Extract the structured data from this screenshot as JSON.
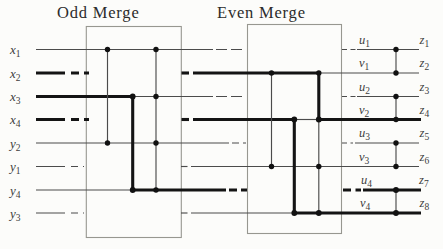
{
  "figure": {
    "titles": {
      "odd_merge": "Odd Merge",
      "even_merge": "Even Merge"
    },
    "inputs": [
      {
        "base": "x",
        "sub": "1"
      },
      {
        "base": "x",
        "sub": "2"
      },
      {
        "base": "x",
        "sub": "3"
      },
      {
        "base": "x",
        "sub": "4"
      },
      {
        "base": "y",
        "sub": "2"
      },
      {
        "base": "y",
        "sub": "1"
      },
      {
        "base": "y",
        "sub": "4"
      },
      {
        "base": "y",
        "sub": "3"
      }
    ],
    "intermediate": [
      {
        "base": "u",
        "sub": "1"
      },
      {
        "base": "v",
        "sub": "1"
      },
      {
        "base": "u",
        "sub": "2"
      },
      {
        "base": "v",
        "sub": "2"
      },
      {
        "base": "u",
        "sub": "3"
      },
      {
        "base": "v",
        "sub": "3"
      },
      {
        "base": "u",
        "sub": "4"
      },
      {
        "base": "v",
        "sub": "4"
      }
    ],
    "outputs": [
      {
        "base": "z",
        "sub": "1"
      },
      {
        "base": "z",
        "sub": "2"
      },
      {
        "base": "z",
        "sub": "3"
      },
      {
        "base": "z",
        "sub": "4"
      },
      {
        "base": "z",
        "sub": "5"
      },
      {
        "base": "z",
        "sub": "6"
      },
      {
        "base": "z",
        "sub": "7"
      },
      {
        "base": "z",
        "sub": "8"
      }
    ],
    "colors": {
      "thin_line": "#4b4b4b",
      "bold_line": "#141414",
      "box_border": "#979790",
      "text": "#3c3c3c",
      "background": "#fcfcfa"
    }
  }
}
